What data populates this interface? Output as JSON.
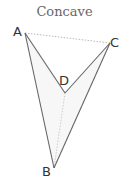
{
  "title": "Concave",
  "vertices": {
    "A": {
      "label": "A",
      "x": 25,
      "y": 33
    },
    "B": {
      "label": "B",
      "x": 54,
      "y": 168
    },
    "C": {
      "label": "C",
      "x": 110,
      "y": 43
    },
    "D": {
      "label": "D",
      "x": 65,
      "y": 93
    }
  },
  "colors": {
    "edge": "#666666",
    "diagonal": "#bbbbbb",
    "fill": "#f7f7f7"
  }
}
